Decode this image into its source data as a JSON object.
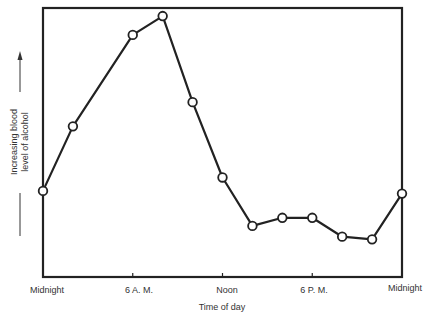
{
  "chart_data": {
    "type": "line",
    "title": "",
    "xlabel": "Time of day",
    "ylabel": "Increasing blood level of alcohol",
    "ylabel_lines": [
      "Increasing blood",
      "level of alcohol"
    ],
    "x_ticks": [
      "Midnight",
      "6 A. M.",
      "Noon",
      "6 P. M.",
      "Midnight"
    ],
    "x_tick_hours": [
      0,
      6,
      12,
      18,
      24
    ],
    "xlim": [
      0,
      24
    ],
    "ylim": [
      0,
      100
    ],
    "grid": false,
    "legend": null,
    "y_axis_arrow": "up",
    "series": [
      {
        "name": "Blood alcohol level",
        "marker": "open-circle",
        "x": [
          0,
          2,
          6,
          8,
          10,
          12,
          14,
          16,
          18,
          20,
          22,
          24
        ],
        "y": [
          32,
          56,
          90,
          97,
          65,
          37,
          19,
          22,
          22,
          15,
          14,
          31
        ]
      }
    ]
  }
}
